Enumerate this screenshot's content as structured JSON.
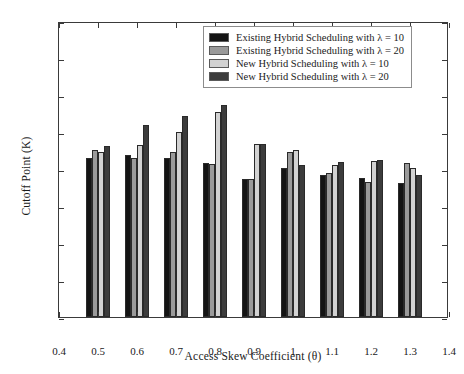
{
  "chart_data": {
    "type": "bar",
    "title": "",
    "xlabel": "Access Skew Coefficient (θ)",
    "ylabel": "Cutoff Point (K)",
    "categories": [
      "0.5",
      "0.6",
      "0.7",
      "0.8",
      "0.9",
      "1",
      "1.1",
      "1.2",
      "1.3"
    ],
    "xlim": [
      0.4,
      1.4
    ],
    "ylim": [
      0,
      800
    ],
    "xticks": [
      "0.4",
      "0.5",
      "0.6",
      "0.7",
      "0.8",
      "0.9",
      "1",
      "1.1",
      "1.2",
      "1.3",
      "1.4"
    ],
    "yticks": [
      "0",
      "100",
      "200",
      "300",
      "400",
      "500",
      "600",
      "700",
      "800"
    ],
    "grid": false,
    "legend_position": "top-right",
    "series": [
      {
        "name": "Existing Hybrid Scheduling with λ = 10",
        "color": "#141414",
        "values": [
          430,
          438,
          430,
          417,
          372,
          404,
          385,
          376,
          363
        ]
      },
      {
        "name": "Existing Hybrid Scheduling with λ = 20",
        "color": "#9a9a9a",
        "values": [
          451,
          429,
          447,
          413,
          372,
          447,
          389,
          364,
          415
        ]
      },
      {
        "name": "New Hybrid Scheduling with λ = 10",
        "color": "#d2d2d2",
        "values": [
          445,
          464,
          499,
          553,
          468,
          451,
          410,
          421,
          404
        ]
      },
      {
        "name": "New Hybrid Scheduling with λ = 20",
        "color": "#3c3c3c",
        "values": [
          462,
          520,
          543,
          574,
          468,
          412,
          418,
          424,
          383
        ]
      }
    ]
  }
}
